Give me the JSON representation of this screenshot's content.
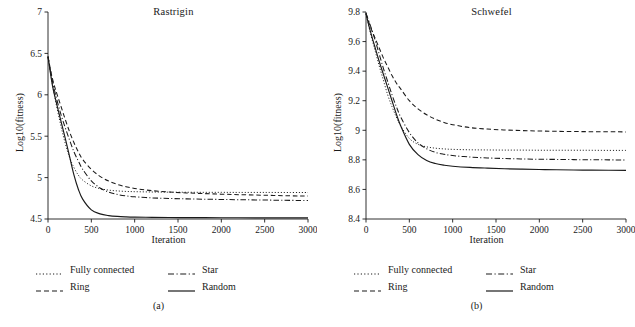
{
  "figure": {
    "panels": [
      {
        "id": "a",
        "title": "Rastrigin",
        "subcaption": "(a)",
        "xlabel": "Iteration",
        "ylabel": "Log10(fitness)"
      },
      {
        "id": "b",
        "title": "Schwefel",
        "subcaption": "(b)",
        "xlabel": "Iteration",
        "ylabel": "Log10(fitness)"
      }
    ],
    "legend": {
      "columns": [
        [
          {
            "label": "Fully connected",
            "style": "dotted",
            "swatch_name": "legend-swatch-fully-connected"
          },
          {
            "label": "Ring",
            "style": "dashed",
            "swatch_name": "legend-swatch-ring"
          }
        ],
        [
          {
            "label": "Star",
            "style": "dashdot",
            "swatch_name": "legend-swatch-star"
          },
          {
            "label": "Random",
            "style": "solid",
            "swatch_name": "legend-swatch-random"
          }
        ]
      ]
    }
  },
  "chart_data": [
    {
      "type": "line",
      "panel": "a",
      "title": "Rastrigin",
      "xlabel": "Iteration",
      "ylabel": "Log10(fitness)",
      "xlim": [
        0,
        3000
      ],
      "ylim": [
        4.5,
        7
      ],
      "xticks": [
        0,
        500,
        1000,
        1500,
        2000,
        2500,
        3000
      ],
      "yticks": [
        4.5,
        5,
        5.5,
        6,
        6.5,
        7
      ],
      "ytick_labels": [
        "4.5",
        "5",
        "5.5",
        "6",
        "6.5",
        "7"
      ],
      "xtick_labels": [
        "0",
        "500",
        "1000",
        "1500",
        "2000",
        "2500",
        "3000"
      ],
      "grid": false,
      "legend_position": "below",
      "color": "#1a1a1a",
      "x": [
        0,
        50,
        100,
        150,
        200,
        250,
        300,
        350,
        400,
        500,
        600,
        700,
        800,
        900,
        1000,
        1200,
        1400,
        1600,
        1800,
        2000,
        2200,
        2500,
        2800,
        3000
      ],
      "series": [
        {
          "name": "Fully connected",
          "style": "dotted",
          "values": [
            6.46,
            6.13,
            5.86,
            5.62,
            5.41,
            5.24,
            5.12,
            5.03,
            4.97,
            4.9,
            4.867,
            4.849,
            4.839,
            4.833,
            4.83,
            4.826,
            4.824,
            4.823,
            4.822,
            4.822,
            4.821,
            4.821,
            4.82,
            4.82
          ]
        },
        {
          "name": "Ring",
          "style": "dashed",
          "values": [
            6.46,
            6.2,
            6.02,
            5.86,
            5.7,
            5.55,
            5.42,
            5.31,
            5.22,
            5.1,
            5.015,
            4.958,
            4.918,
            4.89,
            4.869,
            4.842,
            4.826,
            4.815,
            4.807,
            4.8,
            4.794,
            4.787,
            4.78,
            4.777
          ]
        },
        {
          "name": "Star",
          "style": "dashdot",
          "values": [
            6.46,
            6.17,
            5.95,
            5.76,
            5.6,
            5.45,
            5.31,
            5.2,
            5.1,
            4.96,
            4.875,
            4.826,
            4.797,
            4.779,
            4.768,
            4.755,
            4.748,
            4.743,
            4.739,
            4.736,
            4.733,
            4.729,
            4.725,
            4.723
          ]
        },
        {
          "name": "Random",
          "style": "solid",
          "values": [
            6.46,
            6.12,
            5.89,
            5.68,
            5.47,
            5.25,
            5.03,
            4.86,
            4.74,
            4.61,
            4.562,
            4.541,
            4.531,
            4.526,
            4.523,
            4.52,
            4.518,
            4.517,
            4.516,
            4.515,
            4.515,
            4.514,
            4.514,
            4.514
          ]
        }
      ]
    },
    {
      "type": "line",
      "panel": "b",
      "title": "Schwefel",
      "xlabel": "Iteration",
      "ylabel": "Log10(fitness)",
      "xlim": [
        0,
        3000
      ],
      "ylim": [
        8.4,
        9.8
      ],
      "xticks": [
        0,
        500,
        1000,
        1500,
        2000,
        2500,
        3000
      ],
      "yticks": [
        8.4,
        8.6,
        8.8,
        9.0,
        9.2,
        9.4,
        9.6,
        9.8
      ],
      "ytick_labels": [
        "8.4",
        "8.6",
        "8.8",
        "9",
        "9.2",
        "9.4",
        "9.6",
        "9.8"
      ],
      "xtick_labels": [
        "0",
        "500",
        "1000",
        "1500",
        "2000",
        "2500",
        "3000"
      ],
      "grid": false,
      "legend_position": "below",
      "color": "#1a1a1a",
      "x": [
        0,
        50,
        100,
        150,
        200,
        250,
        300,
        350,
        400,
        500,
        600,
        700,
        800,
        900,
        1000,
        1200,
        1400,
        1600,
        1800,
        2000,
        2200,
        2500,
        2800,
        3000
      ],
      "series": [
        {
          "name": "Fully connected",
          "style": "dotted",
          "values": [
            9.79,
            9.66,
            9.55,
            9.44,
            9.34,
            9.24,
            9.16,
            9.09,
            9.03,
            8.945,
            8.905,
            8.888,
            8.879,
            8.874,
            8.871,
            8.868,
            8.867,
            8.866,
            8.866,
            8.865,
            8.865,
            8.865,
            8.864,
            8.864
          ]
        },
        {
          "name": "Ring",
          "style": "dashed",
          "values": [
            9.79,
            9.7,
            9.63,
            9.56,
            9.49,
            9.43,
            9.37,
            9.32,
            9.28,
            9.2,
            9.145,
            9.105,
            9.075,
            9.053,
            9.038,
            9.018,
            9.008,
            9.002,
            8.998,
            8.995,
            8.993,
            8.991,
            8.99,
            8.989
          ]
        },
        {
          "name": "Star",
          "style": "dashdot",
          "values": [
            9.79,
            9.71,
            9.62,
            9.52,
            9.42,
            9.33,
            9.24,
            9.16,
            9.09,
            8.985,
            8.915,
            8.875,
            8.851,
            8.838,
            8.829,
            8.819,
            8.813,
            8.809,
            8.806,
            8.804,
            8.803,
            8.801,
            8.8,
            8.799
          ]
        },
        {
          "name": "Random",
          "style": "solid",
          "values": [
            9.79,
            9.67,
            9.57,
            9.47,
            9.38,
            9.29,
            9.2,
            9.11,
            9.03,
            8.905,
            8.835,
            8.795,
            8.775,
            8.764,
            8.757,
            8.749,
            8.744,
            8.74,
            8.737,
            8.735,
            8.733,
            8.731,
            8.73,
            8.729
          ]
        }
      ]
    }
  ]
}
